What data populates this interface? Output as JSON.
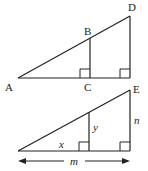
{
  "diagrams": {
    "top": {
      "labels": {
        "A": "A",
        "B": "B",
        "C": "C",
        "D": "D",
        "E": "E"
      }
    },
    "bottom": {
      "labels": {
        "x": "x",
        "y": "y",
        "n": "n",
        "m": "m"
      }
    }
  },
  "colors": {
    "stroke": "#222222",
    "background": "#ffffff"
  }
}
